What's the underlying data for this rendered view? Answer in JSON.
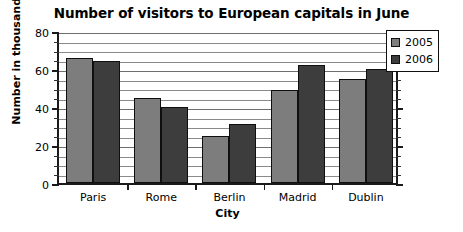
{
  "chart_data": {
    "type": "bar",
    "title": "Number of visitors to European capitals in June",
    "xlabel": "City",
    "ylabel": "Number in thousands",
    "categories": [
      "Paris",
      "Rome",
      "Berlin",
      "Madrid",
      "Dublin"
    ],
    "series": [
      {
        "name": "2005",
        "color": "#7d7d7d",
        "values": [
          66,
          45,
          25,
          49,
          55
        ]
      },
      {
        "name": "2006",
        "color": "#3d3d3d",
        "values": [
          64,
          40,
          31,
          62,
          60
        ]
      }
    ],
    "ylim": [
      0,
      80
    ],
    "ytick_labels": [
      "0",
      "20",
      "40",
      "60",
      "80"
    ],
    "ytick_values": [
      0,
      20,
      40,
      60,
      80
    ],
    "yminor_step": 5,
    "grid": true,
    "grid_axis": "y",
    "legend_position": "top-right",
    "legend_entries": [
      "2005",
      "2006"
    ]
  }
}
